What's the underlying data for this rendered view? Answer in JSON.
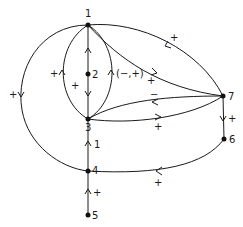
{
  "diagram": {
    "type": "signed directed graph",
    "nodes": [
      {
        "id": "1",
        "label": "1",
        "x": 88,
        "y": 25
      },
      {
        "id": "2",
        "label": "2",
        "x": 88,
        "y": 74
      },
      {
        "id": "3",
        "label": "3",
        "x": 88,
        "y": 119
      },
      {
        "id": "4",
        "label": "4",
        "x": 88,
        "y": 171
      },
      {
        "id": "5",
        "label": "5",
        "x": 88,
        "y": 215
      },
      {
        "id": "6",
        "label": "6",
        "x": 224,
        "y": 139
      },
      {
        "id": "7",
        "label": "7",
        "x": 223,
        "y": 96
      }
    ],
    "edges": [
      {
        "from": "2",
        "to": "1",
        "sign": ""
      },
      {
        "from": "2",
        "to": "3",
        "sign": "+"
      },
      {
        "from": "3",
        "to": "1",
        "path": "left-lens",
        "sign": "+"
      },
      {
        "from": "3",
        "to": "1",
        "path": "right-lens",
        "sign": "(−,+)"
      },
      {
        "from": "1",
        "to": "4",
        "path": "outer-left",
        "sign": "+"
      },
      {
        "from": "7",
        "to": "1",
        "path": "top",
        "sign": "+"
      },
      {
        "from": "1",
        "to": "7",
        "path": "middle",
        "sign": "+"
      },
      {
        "from": "7",
        "to": "3",
        "path": "upper",
        "sign": "−"
      },
      {
        "from": "3",
        "to": "7",
        "path": "lower",
        "sign": "+"
      },
      {
        "from": "7",
        "to": "6",
        "sign": "+"
      },
      {
        "from": "6",
        "to": "4",
        "sign": "+"
      },
      {
        "from": "4",
        "to": "3",
        "sign": "1"
      },
      {
        "from": "5",
        "to": "4",
        "sign": "+"
      }
    ],
    "labels": {
      "n1": "1",
      "n2": "2",
      "n3": "3",
      "n4": "4",
      "n5": "5",
      "n6": "6",
      "n7": "7",
      "e_left_lens": "+",
      "e_right_lens": "(−,+)",
      "e_2_3": "+",
      "e_outer_left": "+",
      "e_top_7_1": "+",
      "e_mid_1_7": "+",
      "e_upper_7_3": "−",
      "e_lower_3_7": "+",
      "e_7_6": "+",
      "e_6_4": "+",
      "e_4_3": "1",
      "e_5_4": "+"
    }
  }
}
